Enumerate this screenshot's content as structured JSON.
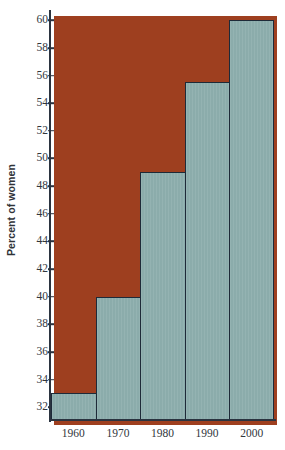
{
  "chart_data": {
    "type": "bar",
    "title": "",
    "subtitle": "",
    "xlabel": "",
    "ylabel": "Percent of women",
    "categories": [
      "1960",
      "1970",
      "1980",
      "1990",
      "2000"
    ],
    "values": [
      33,
      40,
      49,
      55.5,
      60
    ],
    "ylim": [
      31,
      60.6
    ],
    "ytick_values": [
      32,
      34,
      36,
      38,
      40,
      42,
      44,
      46,
      48,
      50,
      52,
      54,
      56,
      58,
      60
    ],
    "ytick_labels": [
      "32",
      "34",
      "36",
      "38",
      "40",
      "42",
      "44",
      "46",
      "48",
      "50",
      "52",
      "54",
      "56",
      "58",
      "60"
    ],
    "grid": false,
    "legend": null,
    "legend_position": "none",
    "bar_fill_color": "#8eafae",
    "bar_edge_color": "#1e2a38",
    "axis_color": "#2b3440",
    "shadow_color": "#9e3f1f",
    "background_color": "#ffffff",
    "tick_label_color": "#31363c",
    "axis_title_color": "#2f3338",
    "bars_touching": true
  }
}
